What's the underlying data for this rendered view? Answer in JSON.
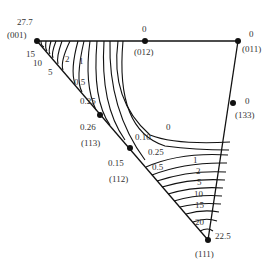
{
  "diagram": {
    "type": "inverse-pole-figure-contour",
    "vertices": [
      {
        "id": "001",
        "label": "(001)",
        "value": "27.7"
      },
      {
        "id": "011",
        "label": "(011)",
        "value": "0"
      },
      {
        "id": "111",
        "label": "(111)",
        "value": "22.5"
      }
    ],
    "edge_points": [
      {
        "id": "012",
        "label": "(012)",
        "value": "0"
      },
      {
        "id": "133",
        "label": "(133)",
        "value": "0"
      },
      {
        "id": "113",
        "label": "(113)",
        "value": "0.26"
      },
      {
        "id": "112",
        "label": "(112)",
        "value": "0.15"
      }
    ],
    "contour_labels_001": [
      "15",
      "10",
      "5",
      "2",
      "1",
      "0.5",
      "0.25"
    ],
    "contour_labels_111": [
      "0",
      "0.10",
      "0.25",
      "0.5",
      "1",
      "2",
      "5",
      "10",
      "15",
      "20"
    ]
  }
}
